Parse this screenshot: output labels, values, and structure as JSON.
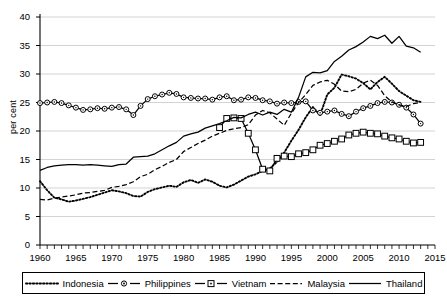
{
  "chart_data": {
    "type": "line",
    "title": "",
    "xlabel": "",
    "ylabel": "per cent",
    "xlim": [
      1960,
      2015
    ],
    "ylim": [
      0,
      40
    ],
    "grid": true,
    "legend_position": "bottom",
    "xticks": [
      "1960",
      "1965",
      "1970",
      "1975",
      "1980",
      "1985",
      "1990",
      "1995",
      "2000",
      "2005",
      "2010",
      "2015"
    ],
    "yticks": [
      "0",
      "5",
      "10",
      "15",
      "20",
      "25",
      "30",
      "35",
      "40"
    ],
    "x_minor_tick_step": 1,
    "series": [
      {
        "name": "Indonesia",
        "style": "dotted",
        "marker": "none",
        "color": "#000000",
        "x": [
          1960,
          1961,
          1962,
          1963,
          1964,
          1965,
          1966,
          1967,
          1968,
          1969,
          1970,
          1971,
          1972,
          1973,
          1974,
          1975,
          1976,
          1977,
          1978,
          1979,
          1980,
          1981,
          1982,
          1983,
          1984,
          1985,
          1986,
          1987,
          1988,
          1989,
          1990,
          1991,
          1992,
          1993,
          1994,
          1995,
          1996,
          1997,
          1998,
          1999,
          2000,
          2001,
          2002,
          2003,
          2004,
          2005,
          2006,
          2007,
          2008,
          2009,
          2010,
          2011,
          2012,
          2013
        ],
        "values": [
          11.2,
          9.6,
          8.3,
          8.0,
          7.6,
          7.8,
          8.1,
          8.4,
          8.8,
          9.2,
          9.6,
          9.4,
          9.1,
          8.6,
          8.5,
          9.3,
          9.8,
          10.1,
          10.4,
          10.2,
          11.0,
          11.4,
          10.9,
          11.5,
          11.1,
          10.4,
          10.1,
          10.6,
          11.3,
          12.0,
          12.4,
          13.0,
          13.4,
          14.6,
          16.2,
          18.3,
          20.2,
          22.4,
          24.2,
          22.8,
          26.4,
          27.6,
          29.9,
          29.6,
          29.2,
          28.4,
          27.3,
          28.6,
          29.5,
          28.3,
          27.0,
          26.2,
          25.4,
          25.1
        ]
      },
      {
        "name": "Philippines",
        "style": "solid",
        "marker": "circle",
        "color": "#000000",
        "x": [
          1960,
          1961,
          1962,
          1963,
          1964,
          1965,
          1966,
          1967,
          1968,
          1969,
          1970,
          1971,
          1972,
          1973,
          1974,
          1975,
          1976,
          1977,
          1978,
          1979,
          1980,
          1981,
          1982,
          1983,
          1984,
          1985,
          1986,
          1987,
          1988,
          1989,
          1990,
          1991,
          1992,
          1993,
          1994,
          1995,
          1996,
          1997,
          1998,
          1999,
          2000,
          2001,
          2002,
          2003,
          2004,
          2005,
          2006,
          2007,
          2008,
          2009,
          2010,
          2011,
          2012,
          2013
        ],
        "values": [
          24.9,
          25.0,
          25.1,
          24.9,
          24.5,
          24.1,
          23.7,
          23.8,
          24.0,
          23.9,
          24.1,
          24.2,
          23.8,
          22.8,
          24.4,
          25.6,
          26.1,
          26.4,
          26.7,
          26.5,
          25.9,
          25.8,
          25.7,
          25.7,
          25.5,
          25.9,
          26.1,
          25.4,
          25.5,
          25.9,
          25.8,
          25.4,
          25.2,
          24.8,
          25.0,
          24.9,
          25.1,
          25.2,
          23.6,
          23.2,
          23.4,
          23.6,
          23.0,
          22.6,
          23.4,
          24.0,
          24.4,
          24.9,
          25.1,
          25.0,
          24.6,
          24.1,
          22.9,
          21.3
        ]
      },
      {
        "name": "Vietnam",
        "style": "solid",
        "marker": "square",
        "color": "#000000",
        "x": [
          1985,
          1986,
          1987,
          1988,
          1989,
          1990,
          1991,
          1992,
          1993,
          1994,
          1995,
          1996,
          1997,
          1998,
          1999,
          2000,
          2001,
          2002,
          2003,
          2004,
          2005,
          2006,
          2007,
          2008,
          2009,
          2010,
          2011,
          2012,
          2013
        ],
        "values": [
          20.6,
          22.2,
          22.3,
          22.2,
          19.6,
          16.7,
          13.3,
          13.0,
          15.2,
          15.6,
          15.5,
          16.0,
          16.2,
          16.7,
          17.5,
          17.8,
          18.2,
          18.6,
          19.3,
          19.6,
          19.8,
          19.6,
          19.5,
          19.1,
          18.8,
          18.6,
          18.2,
          17.9,
          18.0
        ]
      },
      {
        "name": "Malaysia",
        "style": "dashed",
        "marker": "none",
        "color": "#000000",
        "x": [
          1960,
          1961,
          1962,
          1963,
          1964,
          1965,
          1966,
          1967,
          1968,
          1969,
          1970,
          1971,
          1972,
          1973,
          1974,
          1975,
          1976,
          1977,
          1978,
          1979,
          1980,
          1981,
          1982,
          1983,
          1984,
          1985,
          1986,
          1987,
          1988,
          1989,
          1990,
          1991,
          1992,
          1993,
          1994,
          1995,
          1996,
          1997,
          1998,
          1999,
          2000,
          2001,
          2002,
          2003,
          2004,
          2005,
          2006,
          2007,
          2008,
          2009,
          2010,
          2011,
          2012,
          2013
        ],
        "values": [
          8.0,
          7.9,
          8.2,
          8.4,
          8.6,
          8.8,
          9.1,
          9.2,
          9.4,
          9.6,
          10.1,
          10.3,
          10.6,
          11.1,
          12.0,
          12.4,
          13.2,
          13.8,
          14.5,
          15.0,
          16.4,
          17.1,
          17.8,
          18.4,
          19.1,
          19.6,
          20.1,
          20.4,
          20.6,
          21.1,
          22.8,
          23.6,
          23.2,
          22.1,
          21.0,
          23.1,
          25.0,
          26.4,
          28.0,
          28.6,
          28.9,
          28.2,
          27.0,
          26.9,
          27.3,
          28.4,
          28.9,
          28.0,
          26.2,
          25.1,
          24.6,
          24.3,
          24.8,
          25.0
        ]
      },
      {
        "name": "Thailand",
        "style": "solid",
        "marker": "none",
        "color": "#000000",
        "x": [
          1960,
          1961,
          1962,
          1963,
          1964,
          1965,
          1966,
          1967,
          1968,
          1969,
          1970,
          1971,
          1972,
          1973,
          1974,
          1975,
          1976,
          1977,
          1978,
          1979,
          1980,
          1981,
          1982,
          1983,
          1984,
          1985,
          1986,
          1987,
          1988,
          1989,
          1990,
          1991,
          1992,
          1993,
          1994,
          1995,
          1996,
          1997,
          1998,
          1999,
          2000,
          2001,
          2002,
          2003,
          2004,
          2005,
          2006,
          2007,
          2008,
          2009,
          2010,
          2011,
          2012,
          2013
        ],
        "values": [
          13.1,
          13.6,
          13.9,
          14.0,
          14.1,
          14.1,
          14.0,
          14.1,
          14.0,
          13.9,
          13.8,
          14.1,
          14.2,
          15.4,
          15.5,
          15.6,
          16.0,
          16.7,
          17.4,
          18.0,
          19.1,
          19.5,
          19.8,
          20.5,
          20.9,
          21.3,
          21.8,
          22.4,
          22.3,
          22.9,
          23.3,
          22.8,
          23.3,
          22.9,
          23.8,
          23.3,
          25.9,
          29.5,
          30.3,
          30.2,
          30.6,
          32.2,
          33.1,
          34.2,
          34.8,
          35.6,
          36.6,
          36.2,
          36.8,
          35.4,
          36.6,
          34.9,
          34.6,
          33.8
        ]
      }
    ]
  },
  "legend": {
    "items": [
      {
        "label": "Indonesia",
        "key": "dotted-line-key"
      },
      {
        "label": "Philippines",
        "key": "circle-marker-line-key"
      },
      {
        "label": "Vietnam",
        "key": "square-marker-line-key"
      },
      {
        "label": "Malaysia",
        "key": "dashed-line-key"
      },
      {
        "label": "Thailand",
        "key": "solid-line-key"
      }
    ]
  }
}
